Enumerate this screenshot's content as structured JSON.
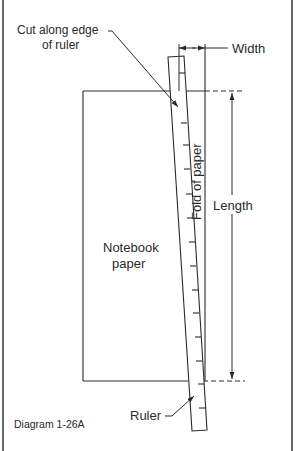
{
  "diagram": {
    "caption": "Diagram 1-26A",
    "labels": {
      "cut_line1": "Cut along edge",
      "cut_line2": "of ruler",
      "width": "Width",
      "fold": "Fold of paper",
      "length": "Length",
      "paper_line1": "Notebook",
      "paper_line2": "paper",
      "ruler": "Ruler"
    },
    "colors": {
      "ink": "#2a2a2a",
      "background": "#ffffff",
      "border": "#6a6a6a"
    }
  }
}
